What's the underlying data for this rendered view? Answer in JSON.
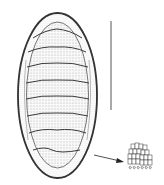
{
  "figure": {
    "parts": {
      "body": "chiton-body",
      "plates": 8,
      "scale_bar": "scale-bar",
      "arrow": "pointer-arrow",
      "inset": "girdle-scales-detail"
    },
    "colors": {
      "ink": "#333333",
      "stipple": "#7a7a7a",
      "background": "#ffffff"
    }
  }
}
